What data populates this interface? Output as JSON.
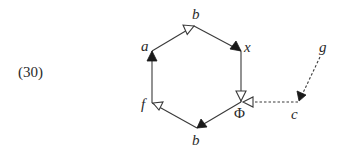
{
  "equation_number": "(30)",
  "colors": {
    "stroke": "#3a3a3a",
    "filled_arrow": "#1a1a1a",
    "open_arrow_fill": "#ffffff",
    "text": "#2a2a2a"
  },
  "nodes": {
    "a": {
      "label": "a"
    },
    "b_top": {
      "label": "b"
    },
    "x": {
      "label": "x"
    },
    "phi": {
      "label": "Φ"
    },
    "b_bottom": {
      "label": "b"
    },
    "f": {
      "label": "f"
    },
    "c": {
      "label": "c"
    },
    "g": {
      "label": "g"
    }
  },
  "edges": [
    {
      "from": "a",
      "to": "b_top",
      "style": "solid",
      "arrowhead": "open"
    },
    {
      "from": "b_top",
      "to": "x",
      "style": "solid",
      "arrowhead": "filled"
    },
    {
      "from": "x",
      "to": "phi",
      "style": "solid",
      "arrowhead": "open"
    },
    {
      "from": "phi",
      "to": "b_bottom",
      "style": "solid",
      "arrowhead": "filled"
    },
    {
      "from": "b_bottom",
      "to": "f",
      "style": "solid",
      "arrowhead": "open"
    },
    {
      "from": "f",
      "to": "a",
      "style": "solid",
      "arrowhead": "filled"
    },
    {
      "from": "c",
      "to": "phi",
      "style": "dashed",
      "arrowhead": "open"
    },
    {
      "from": "g",
      "to": "c",
      "style": "dashed",
      "arrowhead": "filled"
    }
  ]
}
